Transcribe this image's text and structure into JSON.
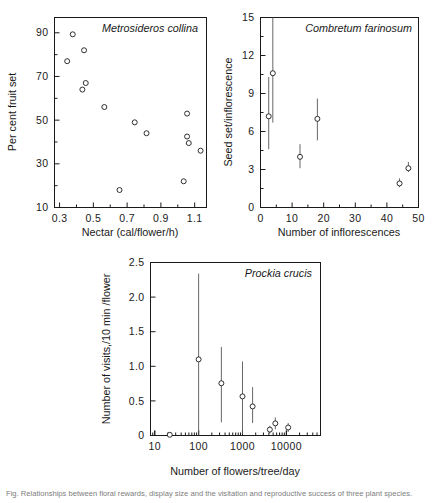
{
  "figure": {
    "caption": "Fig. Relationships between floral rewards, display size and the visitation and reproductive success of three plant species."
  },
  "chart_data": [
    {
      "id": "panel-a",
      "type": "scatter",
      "title": "Metrosideros collina",
      "xlabel": "Nectar (cal/flower/h)",
      "ylabel": "Per cent fruit set",
      "xlim": [
        0.27,
        1.17
      ],
      "ylim": [
        10,
        97
      ],
      "xticks": [
        0.3,
        0.5,
        0.7,
        0.9,
        1.1
      ],
      "xticklabels": [
        "0.3",
        "0.5",
        "0.7",
        "0.9",
        "1.1"
      ],
      "xminorticks": [
        0.4,
        0.6,
        0.8,
        1.0
      ],
      "yticks": [
        10,
        30,
        50,
        70,
        90
      ],
      "yticklabels": [
        "10",
        "30",
        "50",
        "70",
        "90"
      ],
      "yminorticks": [
        20,
        40,
        60,
        80
      ],
      "grid": false,
      "legend": "none",
      "points": [
        {
          "x": 0.345,
          "y": 77.0
        },
        {
          "x": 0.378,
          "y": 89.3
        },
        {
          "x": 0.435,
          "y": 64.0
        },
        {
          "x": 0.445,
          "y": 82.0
        },
        {
          "x": 0.455,
          "y": 67.0
        },
        {
          "x": 0.565,
          "y": 56.0
        },
        {
          "x": 0.655,
          "y": 18.0
        },
        {
          "x": 0.745,
          "y": 49.0
        },
        {
          "x": 0.815,
          "y": 44.0
        },
        {
          "x": 1.035,
          "y": 22.0
        },
        {
          "x": 1.055,
          "y": 53.0
        },
        {
          "x": 1.055,
          "y": 42.5
        },
        {
          "x": 1.065,
          "y": 39.5
        },
        {
          "x": 1.135,
          "y": 36.0
        }
      ]
    },
    {
      "id": "panel-b",
      "type": "scatter",
      "title": "Combretum farinosum",
      "xlabel": "Number of inflorescences",
      "ylabel": "Seed set/inflorescence",
      "xlim": [
        0,
        50
      ],
      "ylim": [
        0,
        15
      ],
      "xticks": [
        0,
        10,
        20,
        30,
        40,
        50
      ],
      "xticklabels": [
        "0",
        "10",
        "20",
        "30",
        "40",
        "50"
      ],
      "xminorticks": [
        5,
        15,
        25,
        35,
        45
      ],
      "yticks": [
        0,
        3,
        6,
        9,
        12,
        15
      ],
      "yticklabels": [
        "0",
        "3",
        "6",
        "9",
        "12",
        "15"
      ],
      "yminorticks": [
        1.5,
        4.5,
        7.5,
        10.5,
        13.5
      ],
      "grid": false,
      "legend": "none",
      "errorbars": "vertical",
      "points": [
        {
          "x": 2.6,
          "y": 7.2,
          "lo": 4.6,
          "hi": 10.3
        },
        {
          "x": 3.9,
          "y": 10.6,
          "lo": 6.7,
          "hi": 15.0
        },
        {
          "x": 12.5,
          "y": 4.0,
          "lo": 3.1,
          "hi": 5.0
        },
        {
          "x": 18.0,
          "y": 7.0,
          "lo": 5.3,
          "hi": 8.6
        },
        {
          "x": 44.0,
          "y": 1.9,
          "lo": 1.6,
          "hi": 2.3
        },
        {
          "x": 46.8,
          "y": 3.1,
          "lo": 2.8,
          "hi": 3.6
        }
      ]
    },
    {
      "id": "panel-c",
      "type": "scatter",
      "title": "Prockia crucis",
      "xlabel": "Number of flowers/tree/day",
      "ylabel": "Number of visits,/10 min /flower",
      "xscale": "log",
      "xlim": [
        8,
        60000
      ],
      "ylim": [
        0,
        2.5
      ],
      "xticks": [
        10,
        100,
        1000,
        10000
      ],
      "xticklabels": [
        "10",
        "100",
        "1000",
        "10000"
      ],
      "yticks": [
        0,
        0.5,
        1.0,
        1.5,
        2.0,
        2.5
      ],
      "yticklabels": [
        "0",
        "0.5",
        "1.0",
        "1.5",
        "2.0",
        "2.5"
      ],
      "grid": false,
      "legend": "none",
      "errorbars": "vertical",
      "points": [
        {
          "x": 22,
          "y": 0.01,
          "lo": 0.0,
          "hi": 0.02
        },
        {
          "x": 100,
          "y": 1.1,
          "lo": 0.0,
          "hi": 2.34
        },
        {
          "x": 330,
          "y": 0.755,
          "lo": 0.19,
          "hi": 1.28
        },
        {
          "x": 1000,
          "y": 0.565,
          "lo": 0.02,
          "hi": 1.07
        },
        {
          "x": 1700,
          "y": 0.42,
          "lo": 0.18,
          "hi": 0.7
        },
        {
          "x": 4200,
          "y": 0.085,
          "lo": 0.03,
          "hi": 0.14
        },
        {
          "x": 5600,
          "y": 0.175,
          "lo": 0.09,
          "hi": 0.26
        },
        {
          "x": 11000,
          "y": 0.115,
          "lo": 0.05,
          "hi": 0.18
        }
      ]
    }
  ]
}
